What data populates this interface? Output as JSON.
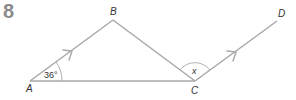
{
  "question_number": "8",
  "colors": {
    "line": "#a8a8a8",
    "arc": "#b0b0b0",
    "text": "#333333",
    "number": "#8a8a8a"
  },
  "points": {
    "A": {
      "label": "A",
      "x": 30,
      "y": 81
    },
    "B": {
      "label": "B",
      "x": 113,
      "y": 20
    },
    "C": {
      "label": "C",
      "x": 195,
      "y": 81
    },
    "D": {
      "label": "D",
      "x": 277,
      "y": 21
    }
  },
  "segments": [
    {
      "from": "A",
      "to": "B",
      "arrow": true
    },
    {
      "from": "B",
      "to": "C",
      "arrow": false
    },
    {
      "from": "A",
      "to": "C",
      "arrow": false
    },
    {
      "from": "C",
      "to": "D",
      "arrow": true
    }
  ],
  "angles": {
    "A": {
      "label": "36°",
      "vertex": "A"
    },
    "C": {
      "label": "x",
      "vertex": "C"
    }
  }
}
